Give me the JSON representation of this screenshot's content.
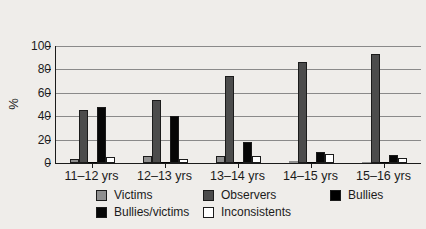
{
  "figure": {
    "background": "#efedea",
    "axis_color": "#1b1b1b",
    "gridline_color": "#8a8a8a"
  },
  "chart_data": {
    "type": "bar",
    "title": "",
    "xlabel": "",
    "ylabel": "%",
    "ylim": [
      0,
      100
    ],
    "yticks": [
      0,
      20,
      40,
      60,
      80,
      100
    ],
    "grid": true,
    "legend_position": "bottom",
    "categories": [
      "11–12 yrs",
      "12–13 yrs",
      "13–14 yrs",
      "14–15 yrs",
      "15–16 yrs"
    ],
    "series": [
      {
        "name": "Victims",
        "color": "#8f8f8f",
        "values": [
          3,
          6,
          6,
          2,
          1
        ]
      },
      {
        "name": "Observers",
        "color": "#4c4c4c",
        "values": [
          45,
          54,
          74,
          86,
          93
        ]
      },
      {
        "name": "Bullies",
        "color": "#000000",
        "values": [
          1,
          1,
          1,
          1,
          1
        ]
      },
      {
        "name": "Bullies/victims",
        "color": "#060606",
        "values": [
          48,
          40,
          18,
          9,
          7
        ]
      },
      {
        "name": "Inconsistents",
        "color": "#ffffff",
        "values": [
          5,
          3,
          6,
          8,
          4
        ]
      }
    ]
  }
}
